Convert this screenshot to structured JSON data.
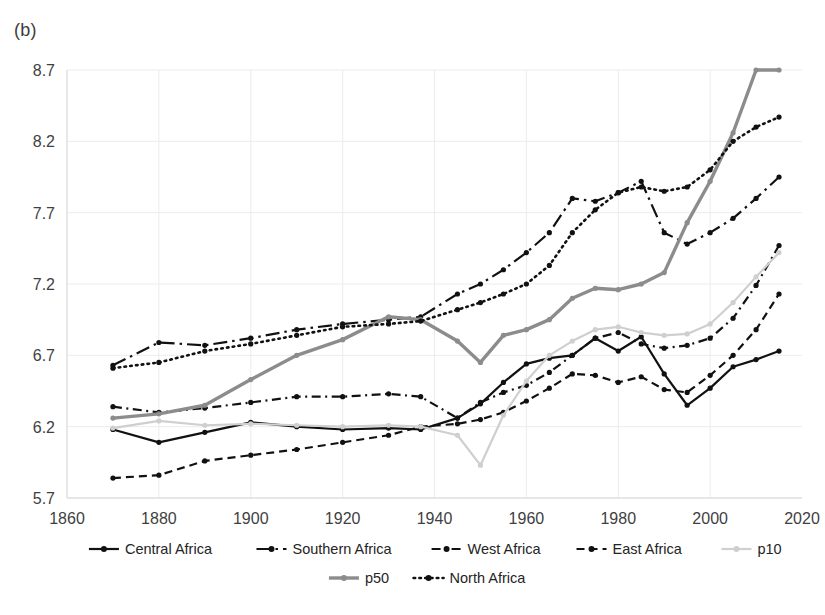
{
  "panel": {
    "label": "(b)"
  },
  "chart_data": {
    "type": "line",
    "title": "",
    "subtitle": "",
    "xlabel": "",
    "ylabel": "",
    "xlim": [
      1860,
      2020
    ],
    "ylim": [
      5.7,
      8.7
    ],
    "xticks": [
      1860,
      1880,
      1900,
      1920,
      1940,
      1960,
      1980,
      2000,
      2020
    ],
    "yticks": [
      5.7,
      6.2,
      6.7,
      7.2,
      7.7,
      8.2,
      8.7
    ],
    "grid": true,
    "legend_position": "bottom",
    "x": [
      1870,
      1880,
      1890,
      1900,
      1910,
      1920,
      1930,
      1937,
      1945,
      1950,
      1955,
      1960,
      1965,
      1970,
      1975,
      1980,
      1985,
      1990,
      1995,
      2000,
      2005,
      2010,
      2015
    ],
    "series": [
      {
        "name": "Central Africa",
        "color": "#111111",
        "style": "solid",
        "marker": "circle",
        "values": [
          6.18,
          6.09,
          6.16,
          6.23,
          6.2,
          6.18,
          6.19,
          6.18,
          6.26,
          6.36,
          6.51,
          6.64,
          6.68,
          6.7,
          6.82,
          6.73,
          6.83,
          6.57,
          6.35,
          6.47,
          6.62,
          6.67,
          6.73
        ]
      },
      {
        "name": "Southern Africa",
        "color": "#111111",
        "style": "dashdot-long",
        "marker": "circle",
        "values": [
          6.63,
          6.79,
          6.77,
          6.82,
          6.88,
          6.92,
          6.95,
          6.97,
          7.13,
          7.2,
          7.3,
          7.42,
          7.56,
          7.8,
          7.78,
          7.84,
          7.92,
          7.56,
          7.48,
          7.56,
          7.66,
          7.8,
          7.95
        ]
      },
      {
        "name": "West Africa",
        "color": "#111111",
        "style": "dashdot-short",
        "marker": "circle",
        "values": [
          6.34,
          6.3,
          6.33,
          6.37,
          6.41,
          6.41,
          6.43,
          6.41,
          6.26,
          6.37,
          6.44,
          6.49,
          6.58,
          6.7,
          6.82,
          6.86,
          6.78,
          6.75,
          6.77,
          6.82,
          6.96,
          7.19,
          7.47
        ]
      },
      {
        "name": "East Africa",
        "color": "#111111",
        "style": "dashed",
        "marker": "circle",
        "values": [
          5.84,
          5.86,
          5.96,
          6.0,
          6.04,
          6.09,
          6.14,
          6.2,
          6.22,
          6.25,
          6.3,
          6.38,
          6.47,
          6.57,
          6.56,
          6.51,
          6.55,
          6.46,
          6.44,
          6.56,
          6.7,
          6.88,
          7.13
        ]
      },
      {
        "name": "p10",
        "color": "#cfcfcf",
        "style": "solid",
        "marker": "circle",
        "values": [
          6.19,
          6.24,
          6.21,
          6.22,
          6.21,
          6.2,
          6.21,
          6.2,
          6.14,
          5.93,
          6.28,
          6.52,
          6.7,
          6.8,
          6.88,
          6.9,
          6.86,
          6.84,
          6.85,
          6.92,
          7.07,
          7.25,
          7.42
        ]
      },
      {
        "name": "p50",
        "color": "#8c8c8c",
        "style": "solid-thick",
        "marker": "circle",
        "values": [
          6.26,
          6.29,
          6.35,
          6.53,
          6.7,
          6.81,
          6.97,
          6.95,
          6.8,
          6.65,
          6.84,
          6.88,
          6.95,
          7.1,
          7.17,
          7.16,
          7.2,
          7.28,
          7.63,
          7.92,
          8.26,
          8.7,
          8.7
        ]
      },
      {
        "name": "North Africa",
        "color": "#111111",
        "style": "dotted",
        "marker": "circle",
        "values": [
          6.61,
          6.65,
          6.73,
          6.78,
          6.84,
          6.9,
          6.92,
          6.94,
          7.02,
          7.07,
          7.13,
          7.2,
          7.33,
          7.56,
          7.72,
          7.84,
          7.88,
          7.85,
          7.88,
          8.0,
          8.2,
          8.3,
          8.37
        ]
      }
    ]
  },
  "legend": {
    "row1": [
      {
        "label": "Central Africa",
        "style": "solid",
        "color": "#111111"
      },
      {
        "label": "Southern Africa",
        "style": "dashdot-long",
        "color": "#111111"
      },
      {
        "label": "West Africa",
        "style": "dashdot-short",
        "color": "#111111"
      },
      {
        "label": "East Africa",
        "style": "dashed",
        "color": "#111111"
      },
      {
        "label": "p10",
        "style": "solid",
        "color": "#cfcfcf"
      }
    ],
    "row2": [
      {
        "label": "p50",
        "style": "solid-thick",
        "color": "#8c8c8c"
      },
      {
        "label": "North Africa",
        "style": "dotted",
        "color": "#111111"
      }
    ]
  },
  "axis": {
    "y_labels": [
      "8.7",
      "8.2",
      "7.7",
      "7.2",
      "6.7",
      "6.2",
      "5.7"
    ],
    "x_labels": [
      "1860",
      "1880",
      "1900",
      "1920",
      "1940",
      "1960",
      "1980",
      "2000",
      "2020"
    ]
  }
}
